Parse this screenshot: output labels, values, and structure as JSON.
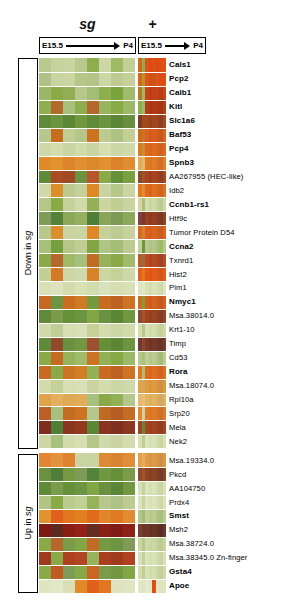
{
  "figure": {
    "type": "heatmap",
    "conditions": [
      {
        "id": "sg",
        "label": "sg",
        "style": "italic-bold"
      },
      {
        "id": "plus",
        "label": "+",
        "style": "bold"
      }
    ],
    "timeline": {
      "start_label": "E15.5",
      "end_label": "P4",
      "arrow_icon": "right-arrow-icon"
    },
    "brackets": [
      {
        "id": "down",
        "label_prefix": "Down in ",
        "label_italic": "sg",
        "label_full": "Down in sg"
      },
      {
        "id": "up",
        "label_prefix": "Up in ",
        "label_italic": "sg",
        "label_full": "Up in sg"
      }
    ]
  },
  "chart_data": {
    "type": "heatmap",
    "title": "",
    "xlabel": "",
    "ylabel": "",
    "colormap": "green-black-red (green = low, red = high)",
    "panels": [
      {
        "name": "sg",
        "columns": 8,
        "x_axis": "developmental time E15.5 -> P4"
      },
      {
        "name": "+",
        "columns": 8,
        "x_axis": "developmental time E15.5 -> P4"
      }
    ],
    "groups": [
      {
        "name": "Down in sg",
        "row_start": 0,
        "row_end": 27
      },
      {
        "name": "Up in sg",
        "row_start": 28,
        "row_end": 33
      }
    ],
    "rows": [
      {
        "gene": "Cals1",
        "bold": true,
        "sg": [
          "#b9c98d",
          "#c7d29c",
          "#c9d4a0",
          "#b9c98d",
          "#8fae4f",
          "#cdd6a5",
          "#9fba64",
          "#c2cf95"
        ],
        "plus": [
          "#cf6a1a",
          "#8fae4f",
          "#d9531a",
          "#dd4a14",
          "#e04f16",
          "#dd4a14",
          "#df4d15",
          "#e05214"
        ]
      },
      {
        "gene": "Pcp2",
        "bold": true,
        "sg": [
          "#aec285",
          "#c9d4a0",
          "#cbd5a2",
          "#b6c78a",
          "#b2c486",
          "#cdd6a5",
          "#bdcb91",
          "#c5d199"
        ],
        "plus": [
          "#cf6a1a",
          "#c28d2c",
          "#d75a18",
          "#d44f16",
          "#cb5418",
          "#dc5418",
          "#da4d15",
          "#de4e14"
        ]
      },
      {
        "gene": "Calb1",
        "bold": true,
        "sg": [
          "#9bb767",
          "#8bab48",
          "#91af52",
          "#b8c88c",
          "#a4bd76",
          "#8fae4f",
          "#7ba33c",
          "#a0bb6a"
        ],
        "plus": [
          "#b57a25",
          "#9fba64",
          "#c9421a",
          "#bd3d16",
          "#c24017",
          "#c14118",
          "#b93c15",
          "#c34419"
        ]
      },
      {
        "gene": "Kitl",
        "bold": true,
        "sg": [
          "#8fae4f",
          "#b06a2a",
          "#a8c07d",
          "#8ead4e",
          "#b4682b",
          "#97b45e",
          "#8aaa47",
          "#9cb869"
        ],
        "plus": [
          "#8fae4f",
          "#9fba64",
          "#b53c16",
          "#a83716",
          "#b03a16",
          "#ae3a17",
          "#a63515",
          "#b23e18"
        ]
      },
      {
        "gene": "Slc1a6",
        "bold": true,
        "sg": [
          "#5e8a39",
          "#6b9440",
          "#5b8737",
          "#71973f",
          "#5e8a39",
          "#6d9441",
          "#5a8636",
          "#698f3e"
        ],
        "plus": [
          "#7b3e23",
          "#9c4b22",
          "#a5451c",
          "#96421f",
          "#a2461d",
          "#9e441e",
          "#8c3f20",
          "#a3481f"
        ]
      },
      {
        "gene": "Baf53",
        "bold": true,
        "sg": [
          "#b8c88c",
          "#c66d20",
          "#c0cd93",
          "#b4c688",
          "#cc7220",
          "#bccb90",
          "#aec285",
          "#c2cf95"
        ],
        "plus": [
          "#cf6a1a",
          "#c9732a",
          "#d9621e",
          "#d15a1c",
          "#db5c1b",
          "#d45c1d",
          "#c8561f",
          "#d96320"
        ]
      },
      {
        "gene": "Pcp4",
        "bold": true,
        "sg": [
          "#cfd8a8",
          "#d4dcae",
          "#cbd5a2",
          "#d2dbac",
          "#c9d4a0",
          "#d6deb2",
          "#cdd6a5",
          "#d0d9aa"
        ],
        "plus": [
          "#d87c20",
          "#c98d3a",
          "#dd6a1c",
          "#da641b",
          "#dd6b1c",
          "#d8661d",
          "#d2601e",
          "#db6a1d"
        ]
      },
      {
        "gene": "Spnb3",
        "bold": true,
        "sg": [
          "#e08a2a",
          "#e2922f",
          "#de842a",
          "#e09031",
          "#dd872c",
          "#e1922f",
          "#dc832a",
          "#df8d2e"
        ],
        "plus": [
          "#e4ab5a",
          "#e8b86d",
          "#e07a22",
          "#dd7424",
          "#e07d26",
          "#d97527",
          "#d46e26",
          "#e08029"
        ]
      },
      {
        "gene": "AA267955 (HEC-like)",
        "bold": false,
        "sg": [
          "#5f8a39",
          "#a94c22",
          "#a04a24",
          "#6c9340",
          "#b8552a",
          "#8aaa47",
          "#649038",
          "#7ba03f"
        ],
        "plus": [
          "#8b4a28",
          "#9b5530",
          "#a9431d",
          "#9c3f20",
          "#a74420",
          "#9f4122",
          "#8f3d24",
          "#a44721"
        ]
      },
      {
        "gene": "Idb2",
        "bold": false,
        "sg": [
          "#cfd8a8",
          "#d88f2c",
          "#bdcb91",
          "#c6d29b",
          "#de8828",
          "#c9d4a0",
          "#b6c78a",
          "#cbd5a2"
        ],
        "plus": [
          "#dd7a1f",
          "#e18c33",
          "#df6a1b",
          "#d9651d",
          "#df6f1e",
          "#d86b20",
          "#d06520",
          "#dc711f"
        ]
      },
      {
        "gene": "Ccnb1-rs1",
        "bold": true,
        "sg": [
          "#b4c688",
          "#8aaa47",
          "#c5d199",
          "#d0d9aa",
          "#94b158",
          "#cbd5a2",
          "#c0cd93",
          "#c9d4a0"
        ],
        "plus": [
          "#d9d4a0",
          "#a8c07d",
          "#d2dbac",
          "#cbd5a2",
          "#d0d9aa",
          "#c5d199",
          "#bccb90",
          "#cfd8a8"
        ]
      },
      {
        "gene": "Htf9c",
        "bold": false,
        "sg": [
          "#7e9c57",
          "#54823a",
          "#8ca85a",
          "#96b061",
          "#4f7e38",
          "#88a558",
          "#7b9a55",
          "#8da95b"
        ],
        "plus": [
          "#86403c",
          "#6d3b34",
          "#993f20",
          "#8e3b22",
          "#953e21",
          "#8a3c23",
          "#7d3825",
          "#923f22"
        ]
      },
      {
        "gene": "Tumor Protein D54",
        "bold": false,
        "sg": [
          "#b8c88c",
          "#d88f2c",
          "#c9d4a0",
          "#cbd5a2",
          "#de8828",
          "#c5d199",
          "#bccb90",
          "#c7d29c"
        ],
        "plus": [
          "#d66a20",
          "#cf8432",
          "#da621e",
          "#d45d20",
          "#d9661f",
          "#d26121",
          "#ca5c22",
          "#d76620"
        ]
      },
      {
        "gene": "Ccna2",
        "bold": true,
        "sg": [
          "#a8c07d",
          "#76a040",
          "#b4c688",
          "#c0cd93",
          "#82a644",
          "#b0c484",
          "#a4bd76",
          "#bdcb91"
        ],
        "plus": [
          "#c2cf95",
          "#6d9441",
          "#b8c88c",
          "#aec285",
          "#b4c688",
          "#a8c07d",
          "#9fba64",
          "#b6c78a"
        ]
      },
      {
        "gene": "Txnrd1",
        "bold": false,
        "sg": [
          "#8aaa47",
          "#b4682b",
          "#9fba64",
          "#a8c07d",
          "#c06c25",
          "#96b35c",
          "#8aaa47",
          "#a0bb6a"
        ],
        "plus": [
          "#b45e2a",
          "#a06a3a",
          "#bb4c20",
          "#ae4522",
          "#b64c21",
          "#ac4723",
          "#a04225",
          "#b34d22"
        ]
      },
      {
        "gene": "Hist2",
        "bold": false,
        "sg": [
          "#c2cf95",
          "#d47a26",
          "#cdd6a5",
          "#d0d9aa",
          "#d8832a",
          "#cbd5a2",
          "#c5d199",
          "#cfd8a8"
        ],
        "plus": [
          "#e0611c",
          "#e2771f",
          "#e25a18",
          "#dd5519",
          "#e25e19",
          "#dc5a1b",
          "#d6551c",
          "#df5c1a"
        ]
      },
      {
        "gene": "Pim1",
        "bold": false,
        "sg": [
          "#d9e0b7",
          "#dce3bd",
          "#d4dcae",
          "#d8e0b5",
          "#d2dbac",
          "#dae2bb",
          "#d6deb2",
          "#d9e0b7"
        ],
        "plus": [
          "#dfe5c0",
          "#e2e8c6",
          "#d9e0b7",
          "#d4dcae",
          "#dae2bb",
          "#d6deb2",
          "#cfd8a8",
          "#dce3bd"
        ]
      },
      {
        "gene": "Nmyc1",
        "bold": true,
        "sg": [
          "#c66722",
          "#6d9441",
          "#ca6d22",
          "#d07a26",
          "#74993f",
          "#c86a22",
          "#be6224",
          "#cc7324"
        ],
        "plus": [
          "#cf6a1a",
          "#7ba03f",
          "#d4601c",
          "#cd5b1e",
          "#d2621d",
          "#cb5d1f",
          "#c35820",
          "#d0611e"
        ]
      },
      {
        "gene": "Msa.38014.0",
        "bold": false,
        "sg": [
          "#5e8a39",
          "#7a9b4a",
          "#649038",
          "#6d9441",
          "#82a644",
          "#6a9140",
          "#5a8636",
          "#719740"
        ],
        "plus": [
          "#8c4a2e",
          "#a4532b",
          "#a04520",
          "#943f22",
          "#9c4421",
          "#924023",
          "#853c26",
          "#9a4522"
        ]
      },
      {
        "gene": "Krt1-10",
        "bold": false,
        "sg": [
          "#d0d9aa",
          "#c0cd93",
          "#d6deb2",
          "#d9e0b7",
          "#c5d199",
          "#d4dcae",
          "#cdd6a5",
          "#d2dbac"
        ],
        "plus": [
          "#d4dcae",
          "#b8c88c",
          "#d9e0b7",
          "#d2dbac",
          "#d6deb2",
          "#cdd6a5",
          "#c5d199",
          "#d0d9aa"
        ]
      },
      {
        "gene": "Timp",
        "bold": false,
        "sg": [
          "#5e8a39",
          "#8f4a2c",
          "#6a9140",
          "#719740",
          "#9c5030",
          "#669038",
          "#5a8636",
          "#6d9441"
        ],
        "plus": [
          "#6f3c33",
          "#8a4530",
          "#7c3a26",
          "#6f3627",
          "#783827",
          "#713629",
          "#66342c",
          "#7a3b28"
        ]
      },
      {
        "gene": "Cd53",
        "bold": false,
        "sg": [
          "#8aaa47",
          "#c46c24",
          "#96b35c",
          "#a0bb6a",
          "#cc7324",
          "#92b055",
          "#86a845",
          "#9cb869"
        ],
        "plus": [
          "#b8c88c",
          "#a8c07d",
          "#c0cd93",
          "#b4c688",
          "#bdcb91",
          "#aec285",
          "#a4bd76",
          "#bccb90"
        ]
      },
      {
        "gene": "Rora",
        "bold": true,
        "sg": [
          "#c86a22",
          "#8aaa47",
          "#cc7324",
          "#d27e27",
          "#92b055",
          "#c86a22",
          "#be6224",
          "#cc7324"
        ],
        "plus": [
          "#e2771f",
          "#a8c07d",
          "#e06b1d",
          "#da661f",
          "#df6e1e",
          "#d86920",
          "#d06321",
          "#dd6d1f"
        ]
      },
      {
        "gene": "Msa.18074.0",
        "bold": false,
        "sg": [
          "#d2dbac",
          "#c5d199",
          "#d6deb2",
          "#d9e0b7",
          "#c9d4a0",
          "#d4dcae",
          "#cdd6a5",
          "#d0d9aa"
        ],
        "plus": [
          "#e0a34a",
          "#d6a758",
          "#e09a3c",
          "#da943e",
          "#de9a3e",
          "#d8943f",
          "#d08d40",
          "#dc983d"
        ]
      },
      {
        "gene": "Rpl10a",
        "bold": false,
        "sg": [
          "#e0a34a",
          "#e4b060",
          "#deaa55",
          "#e1ac58",
          "#a8c07d",
          "#8aaa47",
          "#92b055",
          "#b4c688"
        ],
        "plus": [
          "#e6b86d",
          "#e8c07c",
          "#e4b45f",
          "#deae5f",
          "#e2b360",
          "#dbae62",
          "#d4a862",
          "#e0b15e"
        ]
      },
      {
        "gene": "Srp20",
        "bold": false,
        "sg": [
          "#bd5f24",
          "#a8c07d",
          "#c46c24",
          "#cc7324",
          "#b4c688",
          "#c06925",
          "#b65d26",
          "#c46c24"
        ],
        "plus": [
          "#e28634",
          "#cbd5a2",
          "#df7a26",
          "#d97428",
          "#de7b27",
          "#d77629",
          "#cf6f2a",
          "#dc7a27"
        ]
      },
      {
        "gene": "Mela",
        "bold": false,
        "sg": [
          "#7d2e1e",
          "#4f7e38",
          "#8a3520",
          "#93381f",
          "#5a8636",
          "#883420",
          "#7e3021",
          "#8d3720"
        ],
        "plus": [
          "#a0451f",
          "#5e8a39",
          "#a84520",
          "#9c4022",
          "#a44421",
          "#9c4023",
          "#903c25",
          "#a24520"
        ]
      },
      {
        "gene": "Nek2",
        "bold": false,
        "sg": [
          "#cdd6a5",
          "#a8c07d",
          "#d2dbac",
          "#d6deb2",
          "#b4c688",
          "#d0d9aa",
          "#c9d4a0",
          "#d4dcae"
        ],
        "plus": [
          "#d9e0b7",
          "#c0cd93",
          "#dce3bd",
          "#d6deb2",
          "#dae2bb",
          "#d2dbac",
          "#cbd5a2",
          "#d8e0b5"
        ]
      },
      {
        "gene": "Msa.19334.0",
        "bold": false,
        "sg": [
          "#e28634",
          "#e4923d",
          "#de8430",
          "",
          "#c9d4a0",
          "#dd8a36",
          "#d88433",
          "#e08f39"
        ],
        "plus": [
          "#e2a04a",
          "#e6ad5c",
          "#e09b44",
          "#da9546",
          "#de9b46",
          "#d89547",
          "#d08e48",
          "#dc9945"
        ]
      },
      {
        "gene": "Pkcd",
        "bold": false,
        "sg": [
          "#6a9140",
          "#4f7e38",
          "#769a44",
          "#7e9c57",
          "#54823a",
          "#719740",
          "#669038",
          "#7a9b4a"
        ],
        "plus": [
          "#8c4a2e",
          "#a4532b",
          "#904524",
          "#843f26",
          "#8c4425",
          "#824027",
          "#763c2a",
          "#8a4526"
        ]
      },
      {
        "gene": "AA104750",
        "bold": false,
        "sg": [
          "#5e8a39",
          "#7a9b4a",
          "#669038",
          "#6d9441",
          "#82a644",
          "#6a9140",
          "#5a8636",
          "#719740"
        ],
        "plus": [
          "#d9e0b7",
          "#c5d199",
          "#dce3bd",
          "#d6deb2",
          "#dae2bb",
          "#d2dbac",
          "#cbd5a2",
          "#d8e0b5"
        ]
      },
      {
        "gene": "Prdx4",
        "bold": false,
        "sg": [
          "#b0c484",
          "#8aaa47",
          "#bccb90",
          "#c2cf95",
          "#96b35c",
          "#b8c88c",
          "#aec285",
          "#bdcb91"
        ],
        "plus": [
          "#dce3bd",
          "#c9d4a0",
          "#dfe5c0",
          "#d9e0b7",
          "#dce3bd",
          "#d6deb2",
          "#cfd8a8",
          "#dae2bb"
        ]
      },
      {
        "gene": "Smst",
        "bold": true,
        "sg": [
          "#e2922f",
          "#e0611c",
          "#e2771f",
          "#e0801f",
          "#e06b1d",
          "#e2852a",
          "#e07a22",
          "#e18c33"
        ],
        "plus": [
          "#b4c688",
          "#a4bd76",
          "#c0cd93",
          "#b8c88c",
          "#bccb90",
          "#aec285",
          "#a8c07d",
          "#bdcb91"
        ]
      },
      {
        "gene": "Msh2",
        "bold": false,
        "sg": [
          "#7d1a12",
          "#5c2a1e",
          "#8a2014",
          "#932116",
          "#622c20",
          "#882015",
          "#7e1c13",
          "#8d2116"
        ],
        "plus": [
          "#7a3e30",
          "#66362f",
          "#6f3626",
          "#643024",
          "#6c3425",
          "#623026",
          "#582c28",
          "#6a3426"
        ]
      },
      {
        "gene": "Msa.38724.0",
        "bold": false,
        "sg": [
          "#8aaa47",
          "#b4682b",
          "#7a9b4a",
          "#82a644",
          "#c06c25",
          "#769a44",
          "#6d9441",
          "#7e9c57"
        ],
        "plus": [
          "#cbd5a2",
          "#b8c88c",
          "#cfd8a8",
          "#c9d4a0",
          "#cdd6a5",
          "#c2cf95",
          "#bccb90",
          "#c9d4a0"
        ]
      },
      {
        "gene": "Msa.38345.0 Zn-finger",
        "bold": false,
        "sg": [
          "#a03a1e",
          "#8aaa47",
          "#ae4120",
          "#b44523",
          "#96b35c",
          "#aa3f1f",
          "#a03a1e",
          "#b04222"
        ],
        "plus": [
          "#d9e0b7",
          "#c5d199",
          "#dce3bd",
          "#d6deb2",
          "#dae2bb",
          "#d2dbac",
          "#cbd5a2",
          "#d8e0b5"
        ]
      },
      {
        "gene": "Gsta4",
        "bold": true,
        "sg": [
          "#8aaa47",
          "#c05a22",
          "#7e9c57",
          "#86a845",
          "#ca6622",
          "#7a9b4a",
          "#719740",
          "#82a644"
        ],
        "plus": [
          "#d4dcae",
          "#c0cd93",
          "#d9e0b7",
          "#d2dbac",
          "#d6deb2",
          "#cdd6a5",
          "#c5d199",
          "#d0d9aa"
        ]
      },
      {
        "gene": "Apoe",
        "bold": true,
        "sg": [
          "#dfe5c0",
          "#e2e8c6",
          "#d9e0b7",
          "#e08a2a",
          "#e0611c",
          "#e2771f",
          "#dce3bd",
          "#dfe5c0"
        ],
        "plus": [
          "#e2e8c6",
          "#dfe5c0",
          "#e4ead0",
          "#e2e8c6",
          "#e04f16",
          "#e2e8c6",
          "#dce3bd",
          "#dfe5c0"
        ]
      }
    ]
  }
}
